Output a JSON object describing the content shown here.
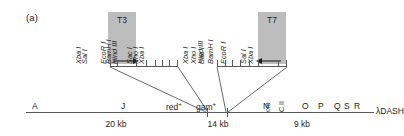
{
  "figure": {
    "panel_label": "(a)",
    "vector_name": "λDASH",
    "colors": {
      "promoter_box": "#bdbdbd",
      "line": "#58595b",
      "text": "#231f20",
      "background": "#ffffff"
    }
  },
  "promoters": [
    {
      "id": "t3",
      "label": "T3",
      "arrow": "right"
    },
    {
      "id": "t7",
      "label": "T7",
      "arrow": "left"
    }
  ],
  "polylinkers": [
    {
      "id": "left-polylinker",
      "promoter": "T3",
      "sites": [
        {
          "name": "Xba I",
          "x": 0
        },
        {
          "name": "Sal I",
          "x": 11
        },
        {
          "name": "EcoR I",
          "x": 44
        },
        {
          "name": "BamH I",
          "x": 58
        },
        {
          "name": "Hind III",
          "x": 72
        },
        {
          "name": "Sac I",
          "x": 80
        },
        {
          "name": "Xho I",
          "x": 88
        },
        {
          "name": "Xba I",
          "x": 96
        }
      ]
    },
    {
      "id": "right-polylinker",
      "promoter": "T7",
      "sites": [
        {
          "name": "Xba I",
          "x": 0
        },
        {
          "name": "Xho I",
          "x": 8
        },
        {
          "name": "Sac I",
          "x": 16
        },
        {
          "name": "Hind III",
          "x": 24
        },
        {
          "name": "BamH I",
          "x": 34
        },
        {
          "name": "EcoR I",
          "x": 46
        },
        {
          "name": "Sal I",
          "x": 80
        },
        {
          "name": "Xba I",
          "x": 92
        }
      ]
    }
  ],
  "genome": {
    "genes_left": [
      {
        "label": "A",
        "vertical": false
      },
      {
        "label": "J",
        "vertical": false
      },
      {
        "label": "red+",
        "vertical": false
      },
      {
        "label": "gam+",
        "vertical": false
      }
    ],
    "genes_right": [
      {
        "label": "N",
        "vertical": false
      },
      {
        "label": "cro",
        "vertical": true
      },
      {
        "label": "C II",
        "vertical": true
      },
      {
        "label": "O",
        "vertical": false
      },
      {
        "label": "P",
        "vertical": false
      },
      {
        "label": "Q",
        "vertical": false
      },
      {
        "label": "S",
        "vertical": false
      },
      {
        "label": "R",
        "vertical": false
      }
    ],
    "segments": [
      {
        "id": "left-arm",
        "size": "20 kb"
      },
      {
        "id": "stuffer",
        "size": "14 kb"
      },
      {
        "id": "right-arm",
        "size": "9 kb"
      }
    ]
  }
}
